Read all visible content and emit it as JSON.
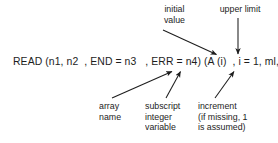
{
  "figure": {
    "background_color": "#ffffff",
    "ink_color": "#1d1d1d",
    "code_line": "READ (n1, n2  , END = n3   , ERR = n4) (A (i)  , i = 1, ml, m2)"
  },
  "callouts": {
    "initial_value": {
      "text": "initial\nvalue",
      "position": "above-right"
    },
    "upper_limit": {
      "text": "upper limit",
      "position": "above-far-right"
    },
    "array_name": {
      "text": "array\nname",
      "position": "below-center-left"
    },
    "subscript_integer_variable": {
      "text": "subscript\ninteger\nvariable",
      "position": "below-center"
    },
    "increment": {
      "text": "increment\n(if missing, 1\nis assumed)",
      "position": "below-right"
    }
  },
  "arrows": [
    {
      "name": "initial-value-arrow",
      "from_label": "initial value",
      "points_to": "i = 1",
      "direction": "down-right",
      "x1": 163,
      "y1": 30,
      "x2": 218,
      "y2": 55
    },
    {
      "name": "upper-limit-arrow",
      "from_label": "upper limit",
      "points_to": "ml",
      "direction": "down",
      "x1": 238,
      "y1": 18,
      "x2": 238,
      "y2": 55
    },
    {
      "name": "array-name-arrow",
      "from_label": "array name",
      "points_to": "A",
      "direction": "up-right",
      "x1": 112,
      "y1": 98,
      "x2": 173,
      "y2": 71
    },
    {
      "name": "subscript-arrow",
      "from_label": "subscript integer variable",
      "points_to": "(i)",
      "direction": "up-right",
      "x1": 166,
      "y1": 98,
      "x2": 181,
      "y2": 71
    },
    {
      "name": "increment-arrow",
      "from_label": "increment",
      "points_to": "m2",
      "direction": "up-right",
      "x1": 215,
      "y1": 98,
      "x2": 235,
      "y2": 71
    }
  ]
}
